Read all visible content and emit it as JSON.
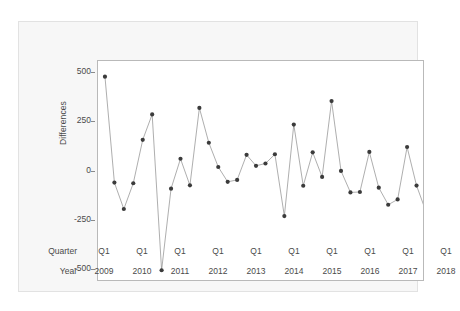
{
  "chart_data": {
    "type": "line",
    "title": "",
    "subtitle": "",
    "xlabel": "",
    "ylabel": "Differences",
    "ylim": [
      -560,
      560
    ],
    "yticks": [
      500,
      250,
      0,
      -250,
      -500
    ],
    "ytick_labels": [
      "500",
      "250",
      "0",
      "-250",
      "-500"
    ],
    "grid": false,
    "legend": null,
    "marker": "filled-circle",
    "line_color": "#8a8a8a",
    "marker_color": "#3b3b3b",
    "x_axis_rows": [
      {
        "name": "Quarter",
        "label": "Quarter"
      },
      {
        "name": "Year",
        "label": "Year"
      }
    ],
    "quarter_tick_label": "Q1",
    "years": [
      "2009",
      "2010",
      "2011",
      "2012",
      "2013",
      "2014",
      "2015",
      "2016",
      "2017",
      "2018"
    ],
    "x_labels": [
      "2009 Q1",
      "2009 Q2",
      "2009 Q3",
      "2009 Q4",
      "2010 Q1",
      "2010 Q2",
      "2010 Q3",
      "2010 Q4",
      "2011 Q1",
      "2011 Q2",
      "2011 Q3",
      "2011 Q4",
      "2012 Q1",
      "2012 Q2",
      "2012 Q3",
      "2012 Q4",
      "2013 Q1",
      "2013 Q2",
      "2013 Q3",
      "2013 Q4",
      "2014 Q1",
      "2014 Q2",
      "2014 Q3",
      "2014 Q4",
      "2015 Q1",
      "2015 Q2",
      "2015 Q3",
      "2015 Q4",
      "2016 Q1",
      "2016 Q2",
      "2016 Q3",
      "2016 Q4",
      "2017 Q1",
      "2017 Q2",
      "2017 Q3",
      "2017 Q4",
      "2018 Q1",
      "2018 Q2",
      "2018 Q3",
      "2018 Q4"
    ],
    "values": [
      480,
      -62,
      -197,
      -65,
      157,
      287,
      -510,
      -93,
      60,
      -76,
      320,
      142,
      18,
      -58,
      -48,
      80,
      24,
      36,
      83,
      -233,
      235,
      -78,
      93,
      -33,
      355,
      -2,
      -112,
      -110,
      95,
      -88,
      -175,
      -148,
      120,
      -77,
      -210,
      103,
      345,
      -110,
      null,
      null
    ],
    "n_points": 38
  },
  "axis": {
    "y_title": "Differences",
    "y_ticks": [
      "500",
      "250",
      "0",
      "-250",
      "-500"
    ]
  }
}
